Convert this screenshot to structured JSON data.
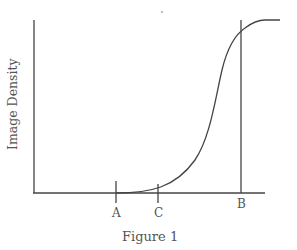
{
  "figure": {
    "caption": "Figure 1",
    "y_axis_label": "Image Density",
    "markers": [
      {
        "label": "A",
        "type": "tick"
      },
      {
        "label": "C",
        "type": "tick"
      },
      {
        "label": "B",
        "type": "vertical-line"
      }
    ],
    "colors": {
      "line": "#444444",
      "text": "#555555",
      "background": "#ffffff"
    }
  }
}
